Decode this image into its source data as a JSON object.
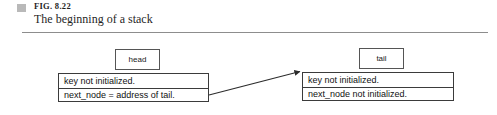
{
  "figure": {
    "marker_color": "#b9b9b9",
    "number": "FIG. 8.22",
    "caption": "The beginning of a stack",
    "rule_color": "#8d8d8d"
  },
  "diagram": {
    "type": "linked-list-node-diagram",
    "pointers": [
      {
        "id": "head",
        "label": "head"
      },
      {
        "id": "tail",
        "label": "tail"
      }
    ],
    "nodes": [
      {
        "id": "head-node",
        "rows": [
          "key not initialized.",
          "next_node = address of tail."
        ]
      },
      {
        "id": "tail-node",
        "rows": [
          "key not initialized.",
          "next_node not initialized."
        ]
      }
    ],
    "arrow": {
      "from": "head-node",
      "to": "tail-node",
      "color": "#2b2b2b"
    }
  }
}
